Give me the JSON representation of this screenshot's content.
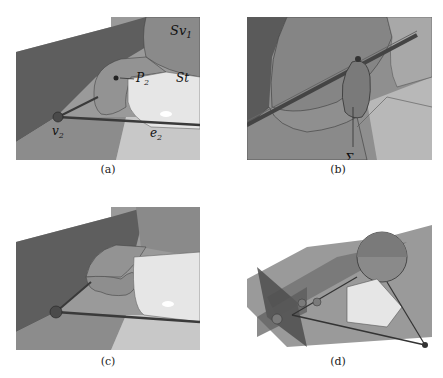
{
  "figure": {
    "panels": [
      {
        "id": "a",
        "caption": "(a)",
        "labels": {
          "sv1": "Sv",
          "sv1_sub": "1",
          "p2": "P",
          "p2_sub": "2",
          "st": "St",
          "v2": "v",
          "v2_sub": "2",
          "e2": "e",
          "e2_sub": "2"
        }
      },
      {
        "id": "b",
        "caption": "(b)",
        "labels": {
          "sigma": "Σ",
          "sigma_sub": "P",
          "sigma_subsub": "2"
        }
      },
      {
        "id": "c",
        "caption": "(c)",
        "labels": {}
      },
      {
        "id": "d",
        "caption": "(d)",
        "labels": {}
      }
    ]
  }
}
